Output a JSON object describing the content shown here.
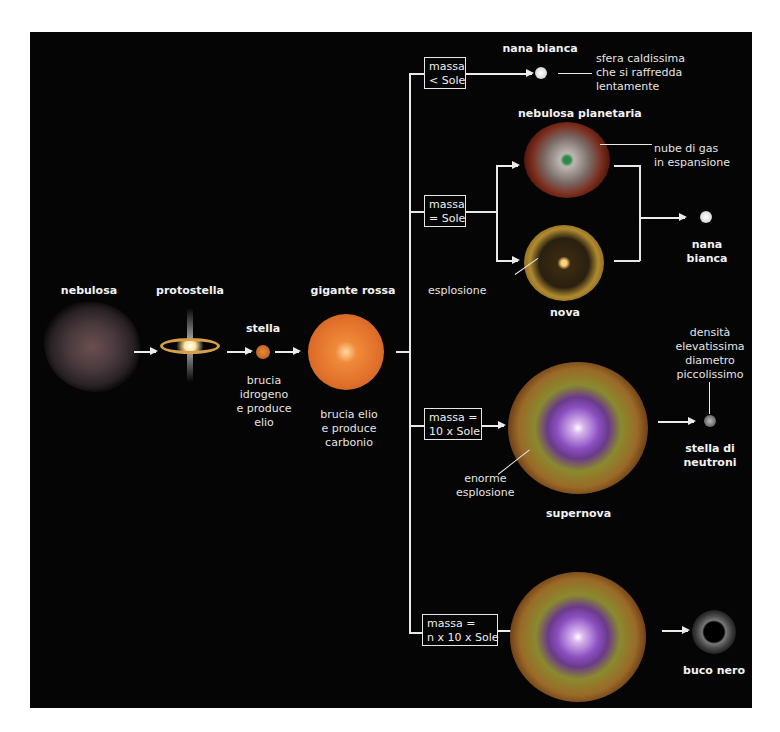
{
  "diagram": {
    "main_sequence": {
      "nebulosa": {
        "label": "nebulosa"
      },
      "protostella": {
        "label": "protostella"
      },
      "stella": {
        "label": "stella",
        "description": [
          "brucia",
          "idrogeno",
          "e produce",
          "elio"
        ]
      },
      "gigante_rossa": {
        "label": "gigante rossa",
        "description": [
          "brucia elio",
          "e produce",
          "carbonio"
        ]
      }
    },
    "branches": [
      {
        "condition": [
          "massa",
          "< Sole"
        ],
        "result": {
          "label": "nana bianca",
          "description": [
            "sfera caldissima",
            "che si raffredda",
            "lentamente"
          ]
        }
      },
      {
        "condition": [
          "massa",
          "= Sole"
        ],
        "paths": [
          {
            "label": "nebulosa planetaria",
            "annotation": [
              "nube di gas",
              "in espansione"
            ]
          },
          {
            "label": "nova",
            "annotation": [
              "esplosione"
            ]
          }
        ],
        "result": {
          "label": [
            "nana",
            "bianca"
          ]
        }
      },
      {
        "condition": [
          "massa =",
          "10 x Sole"
        ],
        "stage": {
          "label": "supernova",
          "annotation": [
            "enorme",
            "esplosione"
          ]
        },
        "result": {
          "label": [
            "stella di",
            "neutroni"
          ],
          "description": [
            "densità",
            "elevatissima",
            "diametro",
            "piccolissimo"
          ]
        }
      },
      {
        "condition": [
          "massa =",
          "n x 10 x Sole"
        ],
        "stage": {
          "label": "supernova"
        },
        "result": {
          "label": "buco nero"
        }
      }
    ],
    "colors": {
      "background": "#050505",
      "lines": "#e8e8e8",
      "text": "#f2f2f2",
      "red_giant": "#e0702a",
      "supernova_core": "#8a4fc0",
      "supernova_shell": "#9a8a2e"
    }
  }
}
